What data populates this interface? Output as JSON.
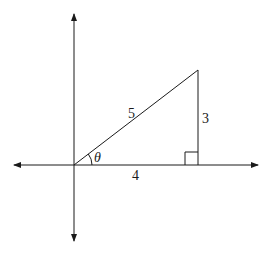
{
  "diagram": {
    "hypotenuse_label": "5",
    "opposite_label": "3",
    "adjacent_label": "4",
    "angle_label": "θ",
    "line_color": "#1a1a1a"
  }
}
